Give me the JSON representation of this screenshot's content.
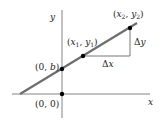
{
  "diagram": {
    "type": "slope-intercept line diagram",
    "axes": {
      "x_label": "x",
      "y_label": "y"
    },
    "points": [
      {
        "label": "(0, 0)",
        "desc": "origin"
      },
      {
        "label": "(0, b)",
        "desc": "y-intercept"
      },
      {
        "label": "(x1, y1)",
        "desc": "first point"
      },
      {
        "label": "(x2, y2)",
        "desc": "second point"
      }
    ],
    "deltas": {
      "dx": "Δx",
      "dy": "Δy"
    },
    "colors": {
      "line": "#666666",
      "axis": "#555555",
      "point": "#000000"
    }
  }
}
